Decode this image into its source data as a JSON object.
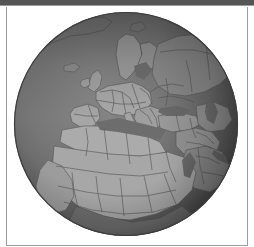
{
  "window": {
    "title": "",
    "titlebar_color": "#555555",
    "frame_border_color": "#9d9d9d",
    "panel_background": "#ffffff"
  },
  "globe": {
    "name": "orthographic-globe",
    "projection": "orthographic",
    "center_lon_deg": 15,
    "center_lat_deg": 30,
    "cx_px": 126,
    "cy_px": 124,
    "radius_px": 112,
    "palette": {
      "ocean_light": "#7d7d7d",
      "ocean_dark": "#4a4a4a",
      "land_light": "#a9a9a9",
      "land_mid": "#9b9b9b",
      "land_dark": "#6e6e6e",
      "border_line": "#5e5e5e",
      "coast_line": "#666666",
      "limb_shadow": "#3f3f3f",
      "terminator": "#464646"
    },
    "region_labels": [
      "Europe",
      "North Africa",
      "Middle East",
      "Scandinavia",
      "Mediterranean Sea",
      "Arabian Peninsula",
      "Sahara",
      "Greenland"
    ],
    "features_shown": [
      "country-borders",
      "coastlines",
      "limb-darkening",
      "terminator-shading"
    ]
  }
}
